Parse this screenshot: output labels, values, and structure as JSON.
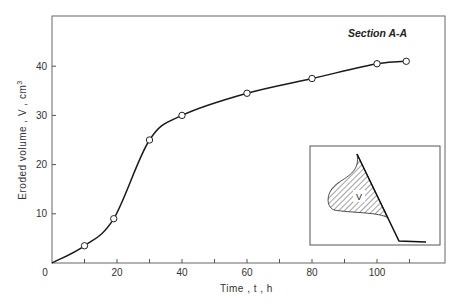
{
  "chart_data": {
    "type": "line",
    "title": "",
    "annotation": "Section  A-A",
    "xlabel": "Time , t , h",
    "ylabel": "Eroded volume , V , cm³",
    "xlim": [
      0,
      120
    ],
    "ylim": [
      0,
      50
    ],
    "x_ticks": [
      0,
      20,
      40,
      60,
      80,
      100
    ],
    "x_minor_ticks": [
      10,
      30,
      50,
      70,
      90,
      110
    ],
    "y_ticks": [
      10,
      20,
      30,
      40
    ],
    "grid": false,
    "legend": null,
    "series": [
      {
        "name": "Eroded volume",
        "marker": "open-circle",
        "x": [
          10,
          19,
          30,
          40,
          60,
          80,
          100,
          109
        ],
        "values": [
          3.5,
          9,
          25,
          30,
          34.5,
          37.5,
          40.5,
          41
        ]
      }
    ],
    "inset": {
      "description": "Cross-section sketch with hatched eroded region",
      "label": "V"
    }
  },
  "labels": {
    "x_tick_labels": [
      "0",
      "20",
      "40",
      "60",
      "80",
      "100"
    ],
    "y_tick_labels": [
      "10",
      "20",
      "30",
      "40"
    ],
    "xlabel": "Time , t , h",
    "ylabel_main": "Eroded volume , V , cm",
    "ylabel_sup": "3",
    "annotation": "Section  A-A",
    "inset_label": "V"
  },
  "colors": {
    "line": "#1a1a1a",
    "axis": "#555555",
    "marker_fill": "#ffffff"
  }
}
